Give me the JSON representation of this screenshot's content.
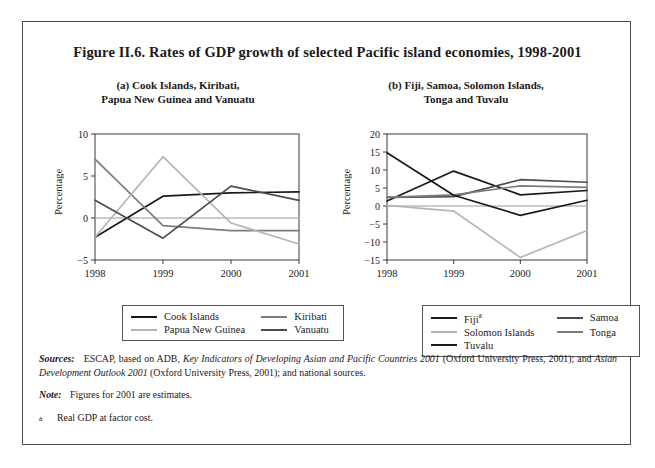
{
  "figure": {
    "title": "Figure II.6.  Rates of GDP growth of selected Pacific island economies, 1998-2001",
    "panel_a_subtitle_line1": "(a)   Cook Islands, Kiribati,",
    "panel_a_subtitle_line2": "Papua New Guinea and Vanuatu",
    "panel_b_subtitle_line1": "(b)   Fiji, Samoa, Solomon Islands,",
    "panel_b_subtitle_line2": "Tonga and Tuvalu"
  },
  "notes": {
    "sources_lead": "Sources:",
    "sources_part1": "ESCAP, based on ADB,",
    "sources_italic1": "Key Indicators of Developing Asian and Pacific Countries 2001",
    "sources_part2": "(Oxford University Press, 2001); and",
    "sources_italic2": "Asian Development Outlook 2001",
    "sources_part3": "(Oxford University Press, 2001); and national sources.",
    "note_lead": "Note:",
    "note_text": "Figures for 2001 are estimates.",
    "footnote_marker": "a",
    "footnote_text": "Real GDP at factor cost."
  },
  "colors": {
    "black": "#1a1a1a",
    "dark_gray": "#4d4d4d",
    "mid_gray": "#7d7d7d",
    "light_gray": "#b5b5b5",
    "axis": "#3a3a3a",
    "zero_line": "#9a9a9a"
  },
  "chart_data": [
    {
      "type": "line",
      "panel": "a",
      "title": "(a)   Cook Islands, Kiribati, Papua New Guinea and Vanuatu",
      "xlabel": "",
      "ylabel": "Percentage",
      "x": [
        "1998",
        "1999",
        "2000",
        "2001"
      ],
      "ylim": [
        -5,
        10
      ],
      "yticks": [
        -5,
        0,
        5,
        10
      ],
      "ytick_labels": [
        "−5",
        "0",
        "5",
        "10"
      ],
      "grid": false,
      "legend_position": "below",
      "series": [
        {
          "name": "Cook Islands",
          "color": "#1a1a1a",
          "values": [
            -2.3,
            2.6,
            3.0,
            3.1
          ]
        },
        {
          "name": "Kiribati",
          "color": "#7d7d7d",
          "values": [
            7.0,
            -0.9,
            -1.5,
            -1.5
          ]
        },
        {
          "name": "Papua New Guinea",
          "color": "#b5b5b5",
          "values": [
            -2.3,
            7.3,
            -0.6,
            -3.1
          ]
        },
        {
          "name": "Vanuatu",
          "color": "#4d4d4d",
          "values": [
            2.1,
            -2.4,
            3.8,
            2.1
          ]
        }
      ]
    },
    {
      "type": "line",
      "panel": "b",
      "title": "(b)   Fiji, Samoa, Solomon Islands, Tonga and Tuvalu",
      "xlabel": "",
      "ylabel": "Percentage",
      "x": [
        "1998",
        "1999",
        "2000",
        "2001"
      ],
      "ylim": [
        -15,
        20
      ],
      "yticks": [
        -15,
        -10,
        -5,
        0,
        5,
        10,
        15,
        20
      ],
      "ytick_labels": [
        "−15",
        "−10",
        "−5",
        "0",
        "5",
        "10",
        "15",
        "20"
      ],
      "grid": false,
      "legend_position": "below",
      "series": [
        {
          "name": "Fiji",
          "color": "#1a1a1a",
          "values": [
            1.4,
            9.7,
            3.1,
            4.3
          ],
          "footnote": "a"
        },
        {
          "name": "Samoa",
          "color": "#4d4d4d",
          "values": [
            2.4,
            2.6,
            7.3,
            6.6
          ]
        },
        {
          "name": "Solomon Islands",
          "color": "#b5b5b5",
          "values": [
            0.2,
            -1.4,
            -14.3,
            -6.8
          ]
        },
        {
          "name": "Tonga",
          "color": "#7d7d7d",
          "values": [
            2.4,
            3.1,
            5.6,
            5.2
          ]
        },
        {
          "name": "Tuvalu",
          "color": "#1a1a1a",
          "values": [
            14.8,
            3.0,
            -2.6,
            1.6
          ]
        }
      ]
    }
  ]
}
